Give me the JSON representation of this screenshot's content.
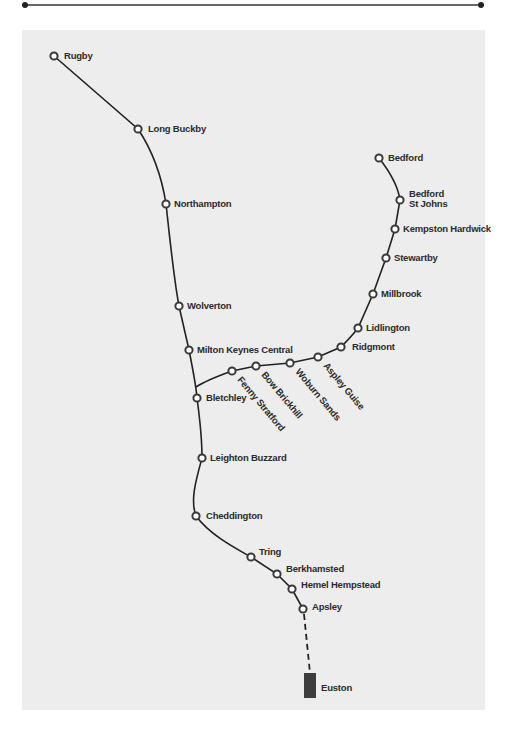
{
  "colors": {
    "track": "#222222",
    "station_ring": "#3a3a3a",
    "panel": "#ededed",
    "terminus": "#3d3d3d",
    "label": "#2b2b2b"
  },
  "map": {
    "main_line": {
      "name": "West Coast Main Line",
      "stations": [
        {
          "id": "rugby",
          "label": "Rugby"
        },
        {
          "id": "long-buckby",
          "label": "Long Buckby"
        },
        {
          "id": "northampton",
          "label": "Northampton"
        },
        {
          "id": "wolverton",
          "label": "Wolverton"
        },
        {
          "id": "milton-keynes-central",
          "label": "Milton Keynes Central"
        },
        {
          "id": "bletchley",
          "label": "Bletchley"
        },
        {
          "id": "leighton-buzzard",
          "label": "Leighton Buzzard"
        },
        {
          "id": "cheddington",
          "label": "Cheddington"
        },
        {
          "id": "tring",
          "label": "Tring"
        },
        {
          "id": "berkhamsted",
          "label": "Berkhamsted"
        },
        {
          "id": "hemel-hempstead",
          "label": "Hemel Hempstead"
        },
        {
          "id": "apsley",
          "label": "Apsley"
        }
      ],
      "terminus": {
        "id": "euston",
        "label": "Euston"
      }
    },
    "branch_line": {
      "name": "Marston Vale Line",
      "stations": [
        {
          "id": "bedford",
          "label": "Bedford"
        },
        {
          "id": "bedford-st-johns",
          "label": "Bedford",
          "label_line2": "St Johns"
        },
        {
          "id": "kempston-hardwick",
          "label": "Kempston Hardwick"
        },
        {
          "id": "stewartby",
          "label": "Stewartby"
        },
        {
          "id": "millbrook",
          "label": "Millbrook"
        },
        {
          "id": "lidlington",
          "label": "Lidlington"
        },
        {
          "id": "ridgmont",
          "label": "Ridgmont"
        },
        {
          "id": "aspley-guise",
          "label": "Aspley Guise"
        },
        {
          "id": "woburn-sands",
          "label": "Woburn Sands"
        },
        {
          "id": "bow-brickhill",
          "label": "Bow Brickhill"
        },
        {
          "id": "fenny-stratford",
          "label": "Fenny Stratford"
        }
      ]
    }
  }
}
